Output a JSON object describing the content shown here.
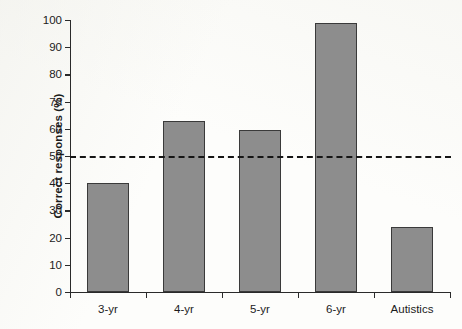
{
  "chart_data": {
    "type": "bar",
    "title": "",
    "subtitle": "",
    "xlabel": "",
    "ylabel": "Correct responses (%)",
    "categories": [
      "3-yr",
      "4-yr",
      "5-yr",
      "6-yr",
      "Autistics"
    ],
    "values": [
      40,
      63,
      59.5,
      99,
      24
    ],
    "series": [
      {
        "name": "Correct responses",
        "values": [
          40,
          63,
          59.5,
          99,
          24
        ]
      }
    ],
    "ylim": [
      0,
      100
    ],
    "yticks": [
      0,
      10,
      20,
      30,
      40,
      50,
      60,
      70,
      80,
      90,
      100
    ],
    "ytick_labels": [
      "0",
      "10",
      "20",
      "30",
      "40",
      "50",
      "60",
      "70",
      "80",
      "90",
      "100"
    ],
    "grid": false,
    "legend": "none",
    "bar_color": "#8d8d8d",
    "bar_edge_color": "#3a3a3a",
    "axis_color": "#2a2a2a",
    "background_color": "#fdfdfb",
    "annotations": [
      {
        "name": "chance-level-line",
        "type": "horizontal-dashed-line",
        "value": 50,
        "color": "#151515"
      }
    ]
  }
}
